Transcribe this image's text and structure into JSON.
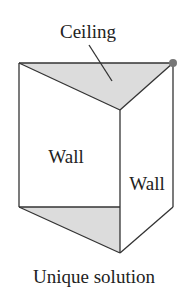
{
  "diagram": {
    "labels": {
      "ceiling": "Ceiling",
      "wall_front": "Wall",
      "wall_side": "Wall",
      "caption": "Unique solution"
    },
    "colors": {
      "stroke": "#333333",
      "shade": "#dcdcdc",
      "vertex_dot": "#777777"
    }
  }
}
